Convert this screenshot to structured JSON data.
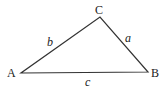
{
  "diagram": {
    "type": "triangle",
    "vertices": [
      {
        "name": "A",
        "x": 21,
        "y": 73,
        "label_x": 7,
        "label_y": 77
      },
      {
        "name": "B",
        "x": 148,
        "y": 72,
        "label_x": 151,
        "label_y": 77
      },
      {
        "name": "C",
        "x": 100,
        "y": 17,
        "label_x": 95,
        "label_y": 14
      }
    ],
    "sides": [
      {
        "name": "a",
        "between": "B-C",
        "label_x": 125,
        "label_y": 42
      },
      {
        "name": "b",
        "between": "A-C",
        "label_x": 47,
        "label_y": 46
      },
      {
        "name": "c",
        "between": "A-B",
        "label_x": 85,
        "label_y": 86
      }
    ],
    "stroke_color": "#333333"
  }
}
